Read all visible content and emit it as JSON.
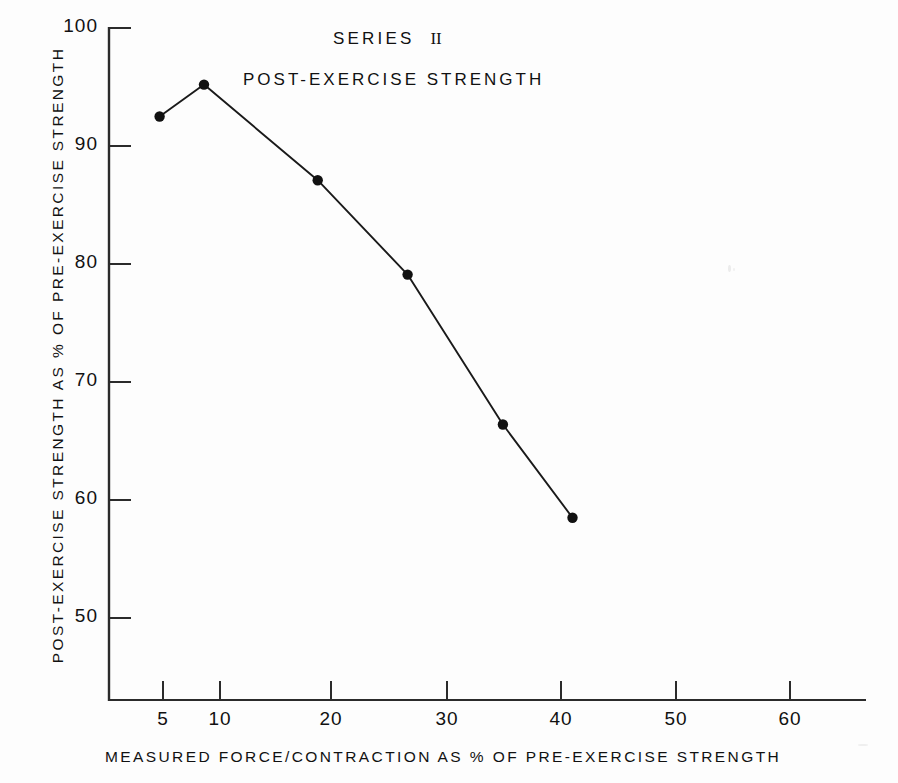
{
  "chart_data": {
    "type": "line",
    "subtitle": "POST-EXERCISE STRENGTH",
    "title_numeral": "II",
    "title_word": "SERIES",
    "xlabel": "MEASURED FORCE/CONTRACTION AS % OF PRE-EXERCISE STRENGTH",
    "ylabel": "POST-EXERCISE STRENGTH AS % OF PRE-EXERCISE STRENGTH",
    "grid": false,
    "legend": "none",
    "xlim": [
      0,
      66
    ],
    "ylim": [
      44,
      100
    ],
    "xticks": [
      5,
      10,
      20,
      30,
      40,
      50,
      60
    ],
    "xtick_labels": [
      "5",
      "10",
      "20",
      "30",
      "40",
      "50",
      "60"
    ],
    "yticks": [
      50,
      60,
      70,
      80,
      90,
      100
    ],
    "ytick_labels": [
      "50",
      "60",
      "70",
      "80",
      "90",
      "100"
    ],
    "x": [
      4.7,
      8.6,
      18.8,
      26.6,
      34.9,
      41.0
    ],
    "values": [
      92.5,
      95.2,
      87.1,
      79.1,
      66.4,
      58.5
    ],
    "series": [
      {
        "name": "Post-exercise strength",
        "x": [
          4.7,
          8.6,
          18.8,
          26.6,
          34.9,
          41.0
        ],
        "values": [
          92.5,
          95.2,
          87.1,
          79.1,
          66.4,
          58.5
        ]
      }
    ],
    "marker": "filled-circle",
    "line_color": "#1a1a1a",
    "marker_color": "#111111",
    "axis_color": "#2b2b2b",
    "background_color": "#fdfdfd"
  }
}
